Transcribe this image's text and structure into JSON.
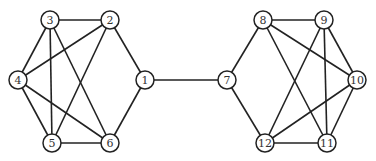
{
  "graph": {
    "nodes": [
      {
        "id": "1",
        "x": 145,
        "y": 80
      },
      {
        "id": "2",
        "x": 110,
        "y": 20
      },
      {
        "id": "3",
        "x": 50,
        "y": 20
      },
      {
        "id": "4",
        "x": 18,
        "y": 80
      },
      {
        "id": "5",
        "x": 52,
        "y": 143
      },
      {
        "id": "6",
        "x": 110,
        "y": 143
      },
      {
        "id": "7",
        "x": 227,
        "y": 80
      },
      {
        "id": "8",
        "x": 263,
        "y": 20
      },
      {
        "id": "9",
        "x": 324,
        "y": 20
      },
      {
        "id": "10",
        "x": 357,
        "y": 80
      },
      {
        "id": "11",
        "x": 327,
        "y": 143
      },
      {
        "id": "12",
        "x": 265,
        "y": 143
      }
    ],
    "edges": [
      [
        "3",
        "2"
      ],
      [
        "3",
        "4"
      ],
      [
        "3",
        "5"
      ],
      [
        "3",
        "6"
      ],
      [
        "2",
        "4"
      ],
      [
        "2",
        "5"
      ],
      [
        "2",
        "1"
      ],
      [
        "4",
        "5"
      ],
      [
        "4",
        "6"
      ],
      [
        "5",
        "6"
      ],
      [
        "6",
        "1"
      ],
      [
        "1",
        "7"
      ],
      [
        "7",
        "8"
      ],
      [
        "7",
        "12"
      ],
      [
        "8",
        "9"
      ],
      [
        "8",
        "10"
      ],
      [
        "8",
        "11"
      ],
      [
        "9",
        "12"
      ],
      [
        "9",
        "11"
      ],
      [
        "9",
        "10"
      ],
      [
        "10",
        "12"
      ],
      [
        "10",
        "11"
      ],
      [
        "12",
        "11"
      ]
    ],
    "node_radius": 9
  }
}
